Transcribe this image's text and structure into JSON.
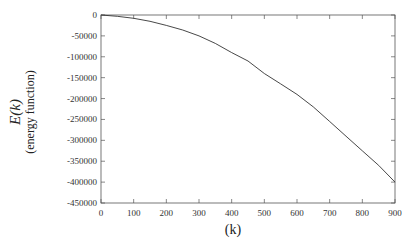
{
  "chart_data": {
    "type": "line",
    "title": "",
    "xlabel": "(k)",
    "ylabel": "E(k) (energy function)",
    "ylabel_main": "E(k)",
    "ylabel_sub": "(energy function)",
    "xlim": [
      0,
      900
    ],
    "ylim": [
      -450000,
      0
    ],
    "xticks": [
      0,
      100,
      200,
      300,
      400,
      500,
      600,
      700,
      800,
      900
    ],
    "yticks": [
      0,
      -50000,
      -100000,
      -150000,
      -200000,
      -250000,
      -300000,
      -350000,
      -400000,
      -450000
    ],
    "grid": false,
    "legend": null,
    "series": [
      {
        "name": "E(k)",
        "color": "#333333",
        "x": [
          0,
          50,
          100,
          150,
          200,
          250,
          300,
          350,
          400,
          450,
          500,
          550,
          600,
          650,
          700,
          750,
          800,
          850,
          900
        ],
        "values": [
          0,
          -3000,
          -8000,
          -15000,
          -25000,
          -36000,
          -50000,
          -68000,
          -90000,
          -110000,
          -140000,
          -165000,
          -190000,
          -220000,
          -255000,
          -290000,
          -325000,
          -360000,
          -400000
        ]
      }
    ]
  }
}
